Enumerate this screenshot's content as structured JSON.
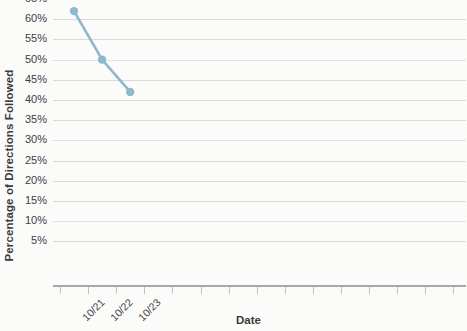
{
  "chart_data": {
    "type": "line",
    "title": "",
    "xlabel": "Date",
    "ylabel": "Percentage of Directions Followed",
    "categories": [
      "10/21",
      "10/22",
      "10/23"
    ],
    "values": [
      62,
      50,
      42
    ],
    "value_labels": [
      "62%",
      "50%",
      "42%"
    ],
    "series": [
      {
        "name": "Percentage of Directions Followed",
        "values": [
          62,
          50,
          42
        ],
        "color": "#8fb8ce",
        "marker": "circle"
      }
    ],
    "ylim": [
      0,
      65
    ],
    "ytick_labels": [
      "65%",
      "60%",
      "55%",
      "50%",
      "45%",
      "40%",
      "35%",
      "30%",
      "25%",
      "20%",
      "15%",
      "10%",
      "5%"
    ],
    "ytick_values": [
      65,
      60,
      55,
      50,
      45,
      40,
      35,
      30,
      25,
      20,
      15,
      10,
      5
    ],
    "ytick_interval": 5,
    "xtick_labels": [
      "10/21",
      "10/22",
      "10/23"
    ],
    "xtick_count": 15,
    "grid": true,
    "grid_axis": "y",
    "legend": "none",
    "colors": {
      "line": "#8fb8ce",
      "marker": "#8fb8ce",
      "gridline": "#d9d9d9",
      "axis": "#a8a8a8",
      "text": "#3a3a3c",
      "background": "#fbfbfa"
    }
  },
  "axis": {
    "y_title": "Percentage of Directions Followed",
    "x_title": "Date"
  },
  "y_ticks": [
    {
      "label": "65%",
      "value": 65
    },
    {
      "label": "60%",
      "value": 60
    },
    {
      "label": "55%",
      "value": 55
    },
    {
      "label": "50%",
      "value": 50
    },
    {
      "label": "45%",
      "value": 45
    },
    {
      "label": "40%",
      "value": 40
    },
    {
      "label": "35%",
      "value": 35
    },
    {
      "label": "30%",
      "value": 30
    },
    {
      "label": "25%",
      "value": 25
    },
    {
      "label": "20%",
      "value": 20
    },
    {
      "label": "15%",
      "value": 15
    },
    {
      "label": "10%",
      "value": 10
    },
    {
      "label": "5%",
      "value": 5
    }
  ],
  "x_ticks": [
    {
      "label": "10/21"
    },
    {
      "label": "10/22"
    },
    {
      "label": "10/23"
    }
  ]
}
